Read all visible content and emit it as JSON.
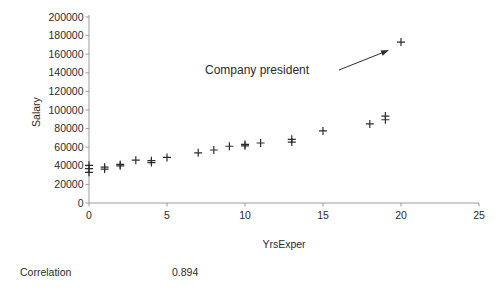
{
  "chart_data": {
    "type": "scatter",
    "title": "",
    "xlabel": "YrsExper",
    "ylabel": "Salary",
    "xlim": [
      0,
      25
    ],
    "ylim": [
      0,
      200000
    ],
    "x_ticks": [
      0,
      5,
      10,
      15,
      20,
      25
    ],
    "y_ticks": [
      0,
      20000,
      40000,
      60000,
      80000,
      100000,
      120000,
      140000,
      160000,
      180000,
      200000
    ],
    "grid": false,
    "legend": "none",
    "marker": "plus",
    "marker_color": "#2d2d2d",
    "axis_color": "#9b9b9b",
    "text_color": "#2b2b2b",
    "points": [
      [
        0,
        33000
      ],
      [
        0,
        37000
      ],
      [
        0,
        40500
      ],
      [
        1,
        36500
      ],
      [
        1,
        38500
      ],
      [
        2,
        40000
      ],
      [
        2,
        41500
      ],
      [
        3,
        46000
      ],
      [
        4,
        43500
      ],
      [
        4,
        45500
      ],
      [
        5,
        49000
      ],
      [
        7,
        54000
      ],
      [
        8,
        57000
      ],
      [
        9,
        61000
      ],
      [
        10,
        61500
      ],
      [
        10,
        63000
      ],
      [
        11,
        64500
      ],
      [
        13,
        65500
      ],
      [
        13,
        68500
      ],
      [
        15,
        77500
      ],
      [
        18,
        85000
      ],
      [
        19,
        89500
      ],
      [
        19,
        93500
      ],
      [
        20,
        173000
      ]
    ],
    "annotation": {
      "text": "Company president",
      "points_to": {
        "x": 20,
        "y": 173000
      }
    }
  },
  "footer": {
    "correlation_label": "Correlation",
    "correlation_value": "0.894"
  }
}
